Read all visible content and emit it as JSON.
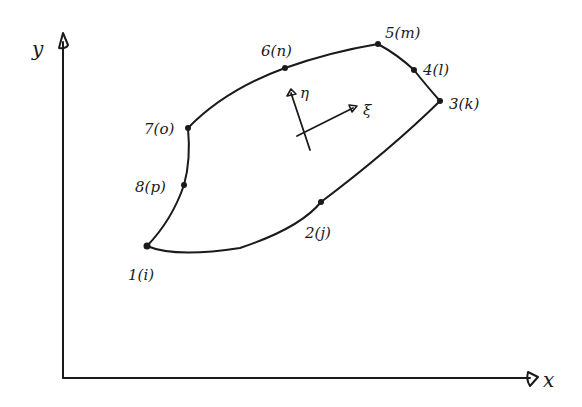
{
  "diagram": {
    "type": "curvilinear quadrilateral finite element (8-node) in global x-y coordinates with local xi-eta axes",
    "axes": {
      "x_label": "x",
      "y_label": "y"
    },
    "local_axes": {
      "xi_label": "ξ",
      "eta_label": "η"
    },
    "nodes": [
      {
        "id": "1",
        "label": "1(i)"
      },
      {
        "id": "2",
        "label": "2(j)"
      },
      {
        "id": "3",
        "label": "3(k)"
      },
      {
        "id": "4",
        "label": "4(l)"
      },
      {
        "id": "5",
        "label": "5(m)"
      },
      {
        "id": "6",
        "label": "6(n)"
      },
      {
        "id": "7",
        "label": "7(o)"
      },
      {
        "id": "8",
        "label": "8(p)"
      }
    ],
    "colors": {
      "ink": "#1a1a1a",
      "background": "#ffffff"
    }
  }
}
